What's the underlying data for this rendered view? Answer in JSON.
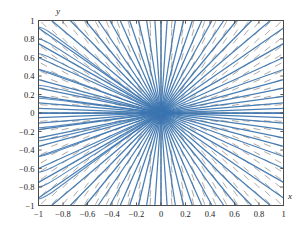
{
  "figure": {
    "background_color": "#ffffff",
    "axis_label_x": "x",
    "axis_label_y": "y"
  },
  "chart_data": {
    "type": "line",
    "title": "",
    "xlabel": "x",
    "ylabel": "y",
    "xlim": [
      -1,
      1
    ],
    "ylim": [
      -1,
      1
    ],
    "grid": false,
    "legend": "none",
    "xticks": [
      -1,
      -0.8,
      -0.6,
      -0.4,
      -0.2,
      0,
      0.2,
      0.4,
      0.6,
      0.8,
      1
    ],
    "xtick_labels": [
      "-1",
      "-0.8",
      "-0.6",
      "-0.4",
      "-0.2",
      "0",
      "0.2",
      "0.4",
      "0.6",
      "0.8",
      "1"
    ],
    "yticks": [
      -1,
      -0.8,
      -0.6,
      -0.4,
      -0.2,
      0,
      0.2,
      0.4,
      0.6,
      0.8,
      1
    ],
    "ytick_labels": [
      "-1",
      "-0.8",
      "-0.6",
      "-0.4",
      "-0.2",
      "0",
      "0.2",
      "0.4",
      "0.6",
      "0.8",
      "1"
    ],
    "streamline_color": "#3d76b0",
    "slopefield_color": "#8a8278",
    "axis_color": "#9a9a9a",
    "frame_color": "#4a4a4a",
    "singular_point": [
      0,
      0
    ],
    "streamline_slopes": [
      0,
      0.05,
      0.11,
      0.18,
      0.27,
      0.36,
      0.47,
      0.6,
      0.75,
      0.92,
      1.12,
      1.35,
      1.62,
      1.95,
      2.4,
      3.0,
      3.9,
      5.4,
      8.5,
      20,
      -0.05,
      -0.11,
      -0.18,
      -0.27,
      -0.36,
      -0.47,
      -0.6,
      -0.75,
      -0.92,
      -1.12,
      -1.35,
      -1.62,
      -1.95,
      -2.4,
      -3.0,
      -3.9,
      -5.4,
      -8.5,
      -20
    ],
    "slopefield_grid_nx": 23,
    "slopefield_grid_ny": 23,
    "slopefield_rule": "dash oriented along the radial direction (y/x), i.e. dy/dx = y/x"
  }
}
